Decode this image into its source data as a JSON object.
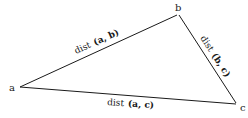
{
  "diagram": {
    "type": "triangle",
    "vertices": [
      {
        "id": "a",
        "label": "a"
      },
      {
        "id": "b",
        "label": "b"
      },
      {
        "id": "c",
        "label": "c"
      }
    ],
    "edges": [
      {
        "from": "a",
        "to": "b",
        "label_prefix": "dist",
        "label_args": "(a, b)"
      },
      {
        "from": "b",
        "to": "c",
        "label_prefix": "dist",
        "label_args": "(b, c)"
      },
      {
        "from": "a",
        "to": "c",
        "label_prefix": "dist",
        "label_args": "(a, c)"
      }
    ],
    "line_color": "#1a1a1a"
  }
}
